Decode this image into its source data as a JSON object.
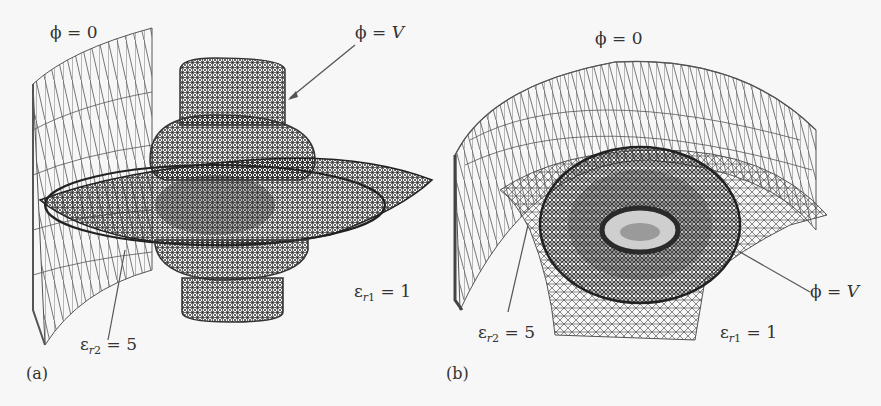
{
  "figure": {
    "panels": [
      {
        "id": "a",
        "tag": "(a)",
        "labels": {
          "outer_boundary": {
            "symbol": "ϕ",
            "eq": " = ",
            "value": "0"
          },
          "inner_conductor": {
            "symbol": "ϕ",
            "eq": " = ",
            "value": "V"
          },
          "dielectric_2": {
            "symbol": "ε",
            "sub_r": "r",
            "sub_n": "2",
            "eq": " = ",
            "value": "5"
          },
          "dielectric_1": {
            "symbol": "ε",
            "sub_r": "r",
            "sub_n": "1",
            "eq": " = ",
            "value": "1"
          }
        }
      },
      {
        "id": "b",
        "tag": "(b)",
        "labels": {
          "outer_boundary": {
            "symbol": "ϕ",
            "eq": " = ",
            "value": "0"
          },
          "inner_conductor": {
            "symbol": "ϕ",
            "eq": " = ",
            "value": "V"
          },
          "dielectric_2": {
            "symbol": "ε",
            "sub_r": "r",
            "sub_n": "2",
            "eq": " = ",
            "value": "5"
          },
          "dielectric_1": {
            "symbol": "ε",
            "sub_r": "r",
            "sub_n": "1",
            "eq": " = ",
            "value": "1"
          }
        }
      }
    ],
    "colors": {
      "background": "#f7f7f7",
      "mesh_light": "#6a6a6a",
      "mesh_dark": "#2e2e2e",
      "text": "#333333",
      "leader_line": "#555555"
    }
  }
}
